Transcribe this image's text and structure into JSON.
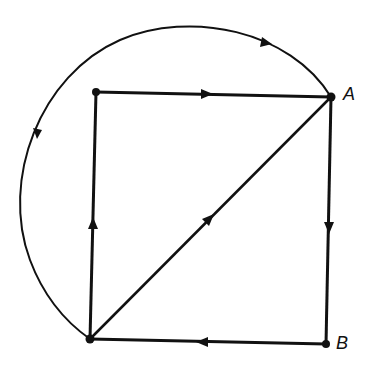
{
  "diagram": {
    "type": "directed-graph",
    "stroke_color": "#111111",
    "nodes": [
      {
        "id": "TL",
        "label": "",
        "x": 96,
        "y": 92
      },
      {
        "id": "A",
        "label": "A",
        "x": 331,
        "y": 97
      },
      {
        "id": "BL",
        "label": "",
        "x": 90,
        "y": 339
      },
      {
        "id": "B",
        "label": "B",
        "x": 326,
        "y": 344
      }
    ],
    "edges": [
      {
        "from": "TL",
        "to": "A",
        "shape": "line"
      },
      {
        "from": "A",
        "to": "B",
        "shape": "line"
      },
      {
        "from": "B",
        "to": "BL",
        "shape": "line"
      },
      {
        "from": "BL",
        "to": "TL",
        "shape": "line"
      },
      {
        "from": "BL",
        "to": "A",
        "shape": "line"
      },
      {
        "from": "A",
        "to": "BL",
        "shape": "arc"
      }
    ],
    "labels": {
      "A": "A",
      "B": "B"
    }
  }
}
